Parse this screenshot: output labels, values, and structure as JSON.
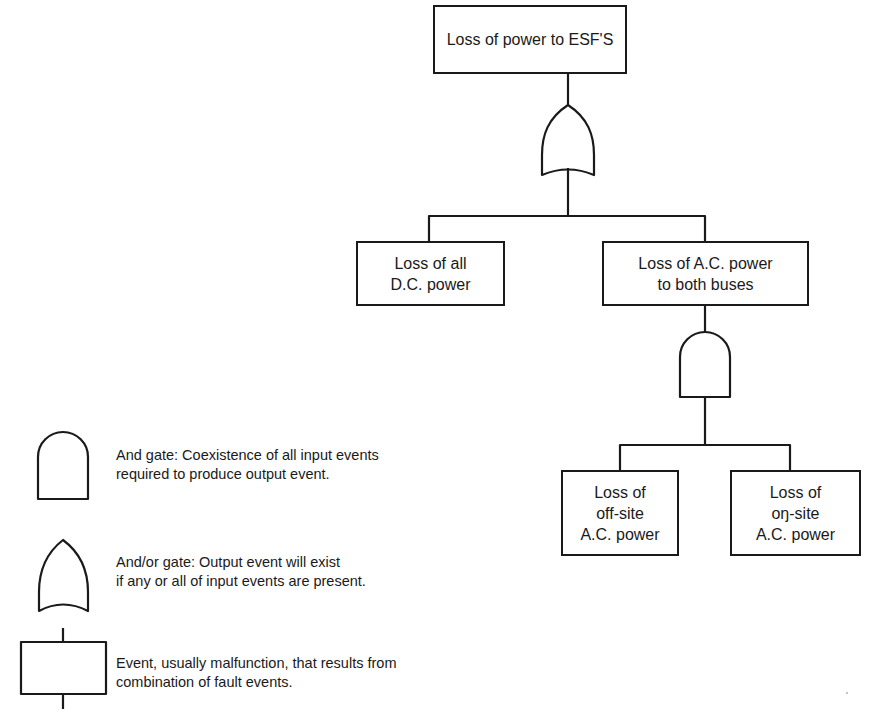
{
  "diagram": {
    "type": "fault-tree",
    "top_event": {
      "id": "esf",
      "label": "Loss of power to ESF'S"
    },
    "gates": [
      {
        "id": "g1",
        "type": "and/or",
        "output": "esf",
        "inputs": [
          "dc",
          "ac"
        ]
      },
      {
        "id": "g2",
        "type": "and",
        "output": "ac",
        "inputs": [
          "offsite",
          "onsite"
        ]
      }
    ],
    "events": {
      "dc": {
        "label": "Loss of all\nD.C. power"
      },
      "ac": {
        "label": "Loss of A.C. power\nto both buses"
      },
      "offsite": {
        "label": "Loss of\noff-site\nA.C. power"
      },
      "onsite": {
        "label": "Loss of\noŋ-site\nA.C. power"
      }
    }
  },
  "legend": {
    "and_gate": {
      "symbol": "and-gate-icon",
      "text": "And gate:  Coexistence of all input events\nrequired to produce output event."
    },
    "or_gate": {
      "symbol": "or-gate-icon",
      "text": "And/or gate:  Output event will exist\nif any or all of input events are present."
    },
    "event": {
      "symbol": "event-box-icon",
      "text": "Event, usually malfunction, that results from\ncombination of fault events."
    }
  },
  "colors": {
    "ink": "#1a1a1a",
    "background": "#ffffff"
  }
}
